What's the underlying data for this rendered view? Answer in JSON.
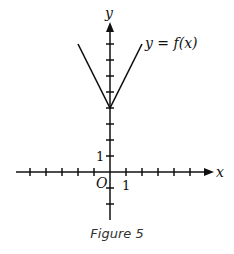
{
  "chart_data": {
    "type": "line",
    "title": "",
    "caption": "Figure 5",
    "xlabel": "x",
    "ylabel": "y",
    "origin_label": "O",
    "x_tick_label": "1",
    "y_tick_label": "1",
    "curve_label": "y = f(x)",
    "series": [
      {
        "name": "y = f(x)",
        "x": [
          -2,
          0,
          2
        ],
        "y": [
          8,
          4,
          8
        ]
      }
    ],
    "xlim": [
      -5,
      6
    ],
    "ylim": [
      -3,
      9
    ],
    "grid": false
  }
}
